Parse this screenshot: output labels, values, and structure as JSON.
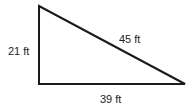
{
  "diagram": {
    "shape": "right triangle",
    "stroke_color": "#1a1a1a",
    "vertices": {
      "top": [
        39,
        6
      ],
      "bottom_left": [
        39,
        84
      ],
      "bottom_right": [
        185,
        84
      ]
    },
    "labels": {
      "left_side": "21 ft",
      "hypotenuse": "45 ft",
      "bottom_side": "39 ft"
    }
  }
}
